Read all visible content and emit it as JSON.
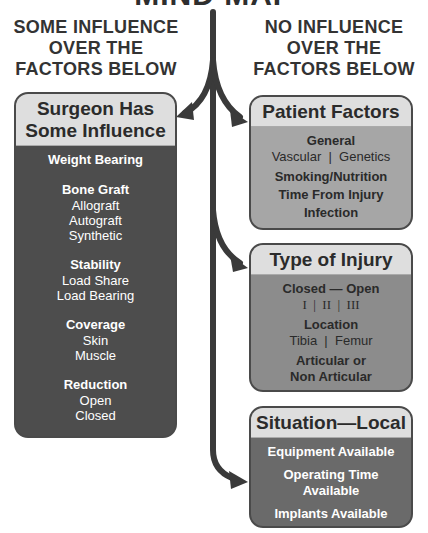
{
  "title": "MIND MAP",
  "columns": {
    "left_heading": [
      "SOME INFLUENCE",
      "OVER THE",
      "FACTORS BELOW"
    ],
    "right_heading": [
      "NO INFLUENCE",
      "OVER THE",
      "FACTORS BELOW"
    ]
  },
  "left_box": {
    "title_lines": [
      "Surgeon Has",
      "Some Influence"
    ],
    "groups": [
      {
        "title": "Weight Bearing",
        "items": []
      },
      {
        "title": "Bone Graft",
        "items": [
          "Allograft",
          "Autograft",
          "Synthetic"
        ]
      },
      {
        "title": "Stability",
        "items": [
          "Load Share",
          "Load Bearing"
        ]
      },
      {
        "title": "Coverage",
        "items": [
          "Skin",
          "Muscle"
        ]
      },
      {
        "title": "Reduction",
        "items": [
          "Open",
          "Closed"
        ]
      }
    ]
  },
  "right_boxes": [
    {
      "title": "Patient Factors",
      "groups": [
        {
          "title": "General",
          "items": [
            "Vascular  |  Genetics"
          ]
        },
        {
          "title": "Smoking/Nutrition",
          "items": []
        },
        {
          "title": "Time From Injury",
          "items": []
        },
        {
          "title": "Infection",
          "items": []
        }
      ]
    },
    {
      "title": "Type of Injury",
      "groups": [
        {
          "title": "Closed — Open",
          "items": [
            "I  |  II  |  III"
          ]
        },
        {
          "title": "Location",
          "items": [
            "Tibia  |  Femur"
          ]
        },
        {
          "title": "Articular or",
          "items": []
        },
        {
          "title": "Non Articular",
          "items": []
        }
      ]
    },
    {
      "title": "Situation—Local",
      "groups": [
        {
          "title": "Equipment Available",
          "items": []
        },
        {
          "title": "Operating Time",
          "items": []
        },
        {
          "title": "Available",
          "items": []
        },
        {
          "title": "Implants Available",
          "items": []
        }
      ]
    }
  ],
  "colors": {
    "arrow": "#3a3a3a",
    "box_header": "#dedede",
    "left_box_body": "#4d4d4d",
    "patient_body": "#a6a6a6",
    "injury_body": "#8c8c8c",
    "situation_body": "#6a6a6a"
  }
}
